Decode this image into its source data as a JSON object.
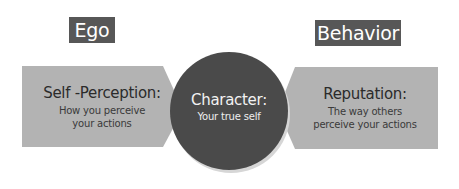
{
  "diagram": {
    "top_labels": {
      "left": "Ego",
      "right": "Behavior"
    },
    "left_shape": {
      "title": "Self -Perception:",
      "subtitle_line1": "How you perceive",
      "subtitle_line2": "your actions"
    },
    "center_shape": {
      "title": "Character:",
      "subtitle": "Your true self"
    },
    "right_shape": {
      "title": "Reputation:",
      "subtitle_line1": "The way others",
      "subtitle_line2": "perceive your actions"
    },
    "colors": {
      "label_box_bg": "#575757",
      "label_box_text": "#ffffff",
      "arrow_fill": "#b3b3b3",
      "circle_fill": "#4a4a4a",
      "circle_shadow": "#d9d9d9",
      "shape_text": "#2b2b2b",
      "circle_text": "#f2f2f2"
    }
  }
}
